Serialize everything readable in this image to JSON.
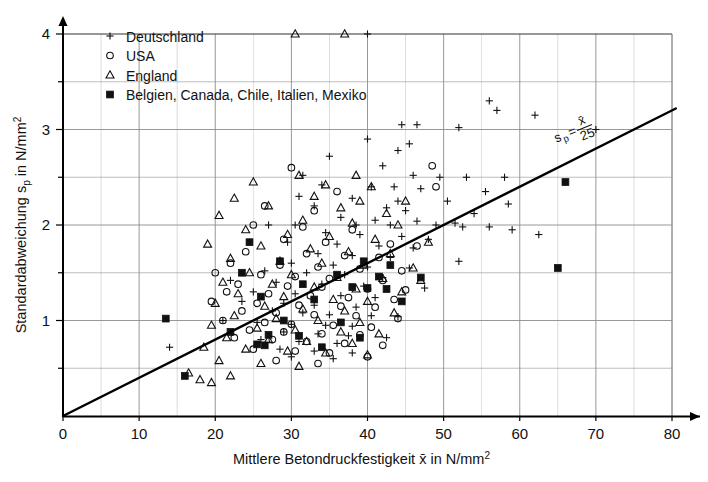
{
  "chart_data": {
    "type": "scatter",
    "title": "",
    "xlabel": "Mittlere Betondruckfestigkeit x̄ in N/mm²",
    "ylabel": "Standardabweichung sₚ in N/mm²",
    "xlabel_parts": {
      "main": "Mittlere Betondruckfestigkeit ",
      "xbar": "x̄",
      "unit": " in N/mm",
      "exp": "2"
    },
    "ylabel_parts": {
      "main": "Standardabweichung s",
      "sub": "p",
      "unit": " in N/mm",
      "exp": "2"
    },
    "xlim": [
      0,
      80
    ],
    "ylim": [
      0,
      4
    ],
    "xticks": [
      0,
      10,
      20,
      30,
      40,
      50,
      60,
      70,
      80
    ],
    "xtick_labels": [
      "0",
      "10",
      "20",
      "30",
      "40",
      "50",
      "60",
      "70",
      "80"
    ],
    "yticks": [
      1,
      2,
      3,
      4
    ],
    "ytick_labels": [
      "1",
      "2",
      "3",
      "4"
    ],
    "x_minor_step": 5,
    "y_minor_step": 0.5,
    "grid": "major-and-minor",
    "grid_color": "#8c8c8c",
    "axis_color": "#000000",
    "legend_position": "top-left-inside",
    "annotation": {
      "text": "sₚ = x̄ / 25",
      "numerator": "x̄",
      "denominator": "25",
      "lhs": "s",
      "lhs_sub": "p",
      "eq": "=",
      "rotation_deg": -22
    },
    "trendline": {
      "label": "s_p = xbar/25",
      "slope": 0.04,
      "intercept": 0,
      "x_start": 0,
      "x_end": 80.5,
      "y_start": 0,
      "y_end": 3.22,
      "color": "#000000",
      "width_px": 2.4
    },
    "series": [
      {
        "name": "Deutschland",
        "marker": "plus",
        "color": "#111111",
        "points": [
          [
            40.0,
            4.0
          ],
          [
            56.0,
            3.3
          ],
          [
            57.0,
            3.2
          ],
          [
            62.0,
            3.15
          ],
          [
            44.5,
            3.05
          ],
          [
            46.5,
            3.05
          ],
          [
            52.0,
            3.02
          ],
          [
            70.0,
            3.0
          ],
          [
            40.0,
            2.9
          ],
          [
            45.5,
            2.85
          ],
          [
            44.0,
            2.78
          ],
          [
            35.0,
            2.72
          ],
          [
            42.0,
            2.62
          ],
          [
            31.5,
            2.52
          ],
          [
            46.0,
            2.52
          ],
          [
            49.5,
            2.5
          ],
          [
            53.0,
            2.5
          ],
          [
            58.0,
            2.5
          ],
          [
            34.0,
            2.42
          ],
          [
            40.5,
            2.4
          ],
          [
            43.5,
            2.4
          ],
          [
            47.0,
            2.38
          ],
          [
            55.5,
            2.35
          ],
          [
            31.0,
            2.3
          ],
          [
            38.0,
            2.28
          ],
          [
            44.0,
            2.25
          ],
          [
            50.5,
            2.25
          ],
          [
            58.5,
            2.22
          ],
          [
            33.0,
            2.2
          ],
          [
            42.5,
            2.18
          ],
          [
            45.0,
            2.15
          ],
          [
            54.0,
            2.12
          ],
          [
            36.5,
            2.08
          ],
          [
            41.0,
            2.05
          ],
          [
            46.5,
            2.04
          ],
          [
            51.5,
            2.02
          ],
          [
            27.0,
            2.0
          ],
          [
            30.5,
            2.0
          ],
          [
            38.5,
            2.0
          ],
          [
            43.0,
            2.0
          ],
          [
            49.0,
            2.0
          ],
          [
            52.5,
            1.98
          ],
          [
            56.0,
            1.98
          ],
          [
            59.0,
            1.95
          ],
          [
            62.5,
            1.9
          ],
          [
            34.5,
            1.92
          ],
          [
            39.0,
            1.9
          ],
          [
            44.5,
            1.88
          ],
          [
            48.0,
            1.85
          ],
          [
            29.5,
            1.82
          ],
          [
            36.0,
            1.8
          ],
          [
            41.5,
            1.78
          ],
          [
            46.0,
            1.76
          ],
          [
            33.5,
            1.7
          ],
          [
            38.0,
            1.68
          ],
          [
            43.0,
            1.66
          ],
          [
            52.0,
            1.62
          ],
          [
            30.0,
            1.6
          ],
          [
            35.5,
            1.58
          ],
          [
            40.0,
            1.56
          ],
          [
            45.5,
            1.55
          ],
          [
            26.5,
            1.52
          ],
          [
            32.0,
            1.5
          ],
          [
            37.0,
            1.48
          ],
          [
            42.0,
            1.45
          ],
          [
            22.0,
            1.42
          ],
          [
            28.0,
            1.4
          ],
          [
            34.0,
            1.38
          ],
          [
            39.5,
            1.36
          ],
          [
            47.5,
            1.34
          ],
          [
            25.0,
            1.3
          ],
          [
            30.5,
            1.28
          ],
          [
            36.5,
            1.26
          ],
          [
            41.0,
            1.24
          ],
          [
            23.5,
            1.2
          ],
          [
            29.0,
            1.18
          ],
          [
            33.0,
            1.16
          ],
          [
            38.5,
            1.14
          ],
          [
            27.5,
            1.1
          ],
          [
            31.5,
            1.08
          ],
          [
            35.0,
            1.06
          ],
          [
            40.5,
            1.05
          ],
          [
            44.0,
            1.04
          ],
          [
            21.0,
            1.0
          ],
          [
            25.5,
            0.98
          ],
          [
            30.0,
            0.96
          ],
          [
            34.5,
            0.95
          ],
          [
            38.0,
            0.94
          ],
          [
            29.0,
            0.88
          ],
          [
            33.5,
            0.86
          ],
          [
            37.5,
            0.84
          ],
          [
            42.5,
            0.82
          ],
          [
            26.0,
            0.8
          ],
          [
            31.0,
            0.78
          ],
          [
            36.0,
            0.76
          ],
          [
            14.0,
            0.72
          ],
          [
            28.5,
            0.7
          ],
          [
            33.0,
            0.68
          ],
          [
            38.0,
            0.66
          ],
          [
            30.0,
            0.62
          ],
          [
            35.5,
            0.6
          ]
        ]
      },
      {
        "name": "USA",
        "marker": "circle",
        "color": "#111111",
        "points": [
          [
            48.5,
            2.62
          ],
          [
            30.0,
            2.6
          ],
          [
            36.0,
            2.35
          ],
          [
            49.0,
            2.4
          ],
          [
            26.5,
            2.2
          ],
          [
            33.0,
            2.15
          ],
          [
            25.0,
            2.0
          ],
          [
            31.5,
            1.98
          ],
          [
            38.0,
            1.95
          ],
          [
            29.0,
            1.85
          ],
          [
            34.5,
            1.82
          ],
          [
            43.0,
            1.8
          ],
          [
            46.5,
            1.78
          ],
          [
            24.0,
            1.72
          ],
          [
            32.0,
            1.7
          ],
          [
            37.0,
            1.68
          ],
          [
            41.5,
            1.66
          ],
          [
            22.0,
            1.6
          ],
          [
            28.5,
            1.58
          ],
          [
            33.5,
            1.56
          ],
          [
            39.0,
            1.54
          ],
          [
            44.5,
            1.52
          ],
          [
            20.0,
            1.5
          ],
          [
            26.0,
            1.48
          ],
          [
            30.5,
            1.46
          ],
          [
            35.0,
            1.44
          ],
          [
            42.0,
            1.42
          ],
          [
            23.0,
            1.38
          ],
          [
            29.5,
            1.36
          ],
          [
            34.0,
            1.35
          ],
          [
            40.0,
            1.33
          ],
          [
            45.0,
            1.32
          ],
          [
            21.5,
            1.3
          ],
          [
            27.0,
            1.28
          ],
          [
            32.5,
            1.26
          ],
          [
            37.5,
            1.24
          ],
          [
            43.5,
            1.22
          ],
          [
            19.5,
            1.2
          ],
          [
            25.5,
            1.18
          ],
          [
            31.0,
            1.16
          ],
          [
            36.5,
            1.15
          ],
          [
            41.0,
            1.14
          ],
          [
            23.5,
            1.1
          ],
          [
            28.0,
            1.08
          ],
          [
            33.0,
            1.06
          ],
          [
            38.5,
            1.05
          ],
          [
            44.0,
            1.02
          ],
          [
            21.0,
            1.0
          ],
          [
            26.5,
            0.98
          ],
          [
            30.0,
            0.96
          ],
          [
            35.5,
            0.95
          ],
          [
            40.5,
            0.93
          ],
          [
            24.5,
            0.9
          ],
          [
            29.0,
            0.88
          ],
          [
            34.0,
            0.86
          ],
          [
            39.0,
            0.85
          ],
          [
            22.5,
            0.82
          ],
          [
            27.5,
            0.8
          ],
          [
            32.0,
            0.78
          ],
          [
            37.0,
            0.76
          ],
          [
            42.0,
            0.74
          ],
          [
            25.0,
            0.7
          ],
          [
            30.5,
            0.68
          ],
          [
            35.0,
            0.66
          ],
          [
            40.0,
            0.62
          ],
          [
            28.0,
            0.58
          ],
          [
            33.5,
            0.55
          ]
        ]
      },
      {
        "name": "England",
        "marker": "triangle",
        "color": "#111111",
        "points": [
          [
            30.5,
            4.0
          ],
          [
            37.0,
            4.0
          ],
          [
            31.0,
            2.52
          ],
          [
            38.5,
            2.52
          ],
          [
            25.0,
            2.45
          ],
          [
            34.5,
            2.42
          ],
          [
            40.5,
            2.4
          ],
          [
            22.5,
            2.28
          ],
          [
            33.0,
            2.3
          ],
          [
            39.0,
            2.25
          ],
          [
            45.0,
            2.25
          ],
          [
            27.0,
            2.2
          ],
          [
            36.5,
            2.18
          ],
          [
            42.5,
            2.12
          ],
          [
            20.5,
            2.1
          ],
          [
            31.5,
            2.05
          ],
          [
            38.0,
            2.02
          ],
          [
            44.0,
            2.0
          ],
          [
            24.0,
            1.95
          ],
          [
            29.5,
            1.9
          ],
          [
            35.0,
            1.88
          ],
          [
            41.0,
            1.85
          ],
          [
            48.0,
            1.82
          ],
          [
            19.0,
            1.8
          ],
          [
            26.0,
            1.78
          ],
          [
            32.5,
            1.75
          ],
          [
            37.5,
            1.72
          ],
          [
            43.0,
            1.7
          ],
          [
            22.0,
            1.65
          ],
          [
            28.5,
            1.62
          ],
          [
            34.0,
            1.6
          ],
          [
            39.5,
            1.58
          ],
          [
            46.0,
            1.55
          ],
          [
            24.5,
            1.5
          ],
          [
            30.0,
            1.48
          ],
          [
            36.0,
            1.45
          ],
          [
            42.0,
            1.44
          ],
          [
            47.0,
            1.42
          ],
          [
            21.0,
            1.4
          ],
          [
            27.5,
            1.38
          ],
          [
            33.0,
            1.35
          ],
          [
            38.5,
            1.33
          ],
          [
            44.5,
            1.3
          ],
          [
            23.0,
            1.28
          ],
          [
            29.0,
            1.25
          ],
          [
            35.5,
            1.22
          ],
          [
            40.0,
            1.2
          ],
          [
            20.0,
            1.18
          ],
          [
            26.5,
            1.15
          ],
          [
            31.5,
            1.12
          ],
          [
            37.0,
            1.1
          ],
          [
            43.5,
            1.08
          ],
          [
            22.5,
            1.05
          ],
          [
            28.0,
            1.02
          ],
          [
            33.5,
            1.0
          ],
          [
            39.0,
            0.98
          ],
          [
            19.5,
            0.95
          ],
          [
            25.5,
            0.92
          ],
          [
            30.5,
            0.9
          ],
          [
            36.5,
            0.88
          ],
          [
            41.5,
            0.86
          ],
          [
            21.5,
            0.82
          ],
          [
            27.0,
            0.8
          ],
          [
            32.0,
            0.78
          ],
          [
            38.0,
            0.76
          ],
          [
            18.5,
            0.72
          ],
          [
            24.0,
            0.7
          ],
          [
            29.5,
            0.68
          ],
          [
            34.5,
            0.66
          ],
          [
            40.0,
            0.64
          ],
          [
            20.5,
            0.58
          ],
          [
            26.0,
            0.55
          ],
          [
            31.0,
            0.52
          ],
          [
            16.5,
            0.45
          ],
          [
            22.0,
            0.42
          ],
          [
            18.0,
            0.38
          ],
          [
            19.5,
            0.35
          ]
        ]
      },
      {
        "name": "Belgien, Canada, Chile, Italien, Mexiko",
        "marker": "square",
        "color": "#111111",
        "points": [
          [
            66.0,
            2.45
          ],
          [
            24.5,
            1.82
          ],
          [
            28.5,
            1.62
          ],
          [
            39.5,
            1.62
          ],
          [
            43.0,
            1.58
          ],
          [
            65.0,
            1.55
          ],
          [
            23.5,
            1.5
          ],
          [
            36.0,
            1.48
          ],
          [
            41.5,
            1.46
          ],
          [
            47.0,
            1.45
          ],
          [
            31.5,
            1.38
          ],
          [
            38.0,
            1.35
          ],
          [
            40.0,
            1.34
          ],
          [
            42.5,
            1.33
          ],
          [
            26.0,
            1.25
          ],
          [
            33.0,
            1.22
          ],
          [
            44.5,
            1.2
          ],
          [
            13.5,
            1.02
          ],
          [
            29.0,
            1.0
          ],
          [
            36.5,
            0.98
          ],
          [
            22.0,
            0.88
          ],
          [
            27.0,
            0.85
          ],
          [
            31.0,
            0.84
          ],
          [
            39.0,
            0.82
          ],
          [
            25.5,
            0.75
          ],
          [
            26.5,
            0.74
          ],
          [
            34.0,
            0.72
          ],
          [
            16.0,
            0.42
          ]
        ]
      }
    ]
  },
  "legend": {
    "items": [
      {
        "label": "Deutschland",
        "marker": "plus"
      },
      {
        "label": "USA",
        "marker": "circle"
      },
      {
        "label": "England",
        "marker": "triangle"
      },
      {
        "label": "Belgien, Canada, Chile, Italien, Mexiko",
        "marker": "square"
      }
    ]
  }
}
